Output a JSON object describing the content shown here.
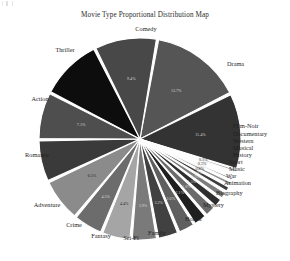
{
  "chart_data": {
    "type": "pie",
    "title": "Movie Type Proportional Distribution Map",
    "xlabel": "",
    "ylabel": "",
    "grid": false,
    "legend_position": "radial-outside-labels",
    "start_angle_deg": -80,
    "direction": "clockwise",
    "categories": [
      "Comedy",
      "Drama",
      "Film-Noir",
      "Documentary",
      "Western",
      "Musical",
      "History",
      "Sport",
      "Music",
      "War",
      "Animation",
      "Biography",
      "Mystery",
      "Horror",
      "Family",
      "Sci-Fi",
      "Fantasy",
      "Crime",
      "Adventure",
      "Romance",
      "Action",
      "Thriller"
    ],
    "values": [
      13.7,
      11.4,
      0.3,
      0.4,
      0.5,
      0.6,
      0.8,
      1.0,
      1.2,
      1.5,
      1.8,
      2.1,
      2.6,
      3.2,
      3.9,
      4.4,
      4.5,
      6.5,
      6.3,
      7.1,
      9.3,
      9.4
    ],
    "slices": [
      {
        "label": "Comedy",
        "value": 13.7,
        "pct_text": "13.7%",
        "color": "#555555",
        "pct_visible": true,
        "pct_on_light": false
      },
      {
        "label": "Drama",
        "value": 11.4,
        "pct_text": "11.4%",
        "color": "#333333",
        "pct_visible": true,
        "pct_on_light": false
      },
      {
        "label": "Film-Noir",
        "value": 0.3,
        "pct_text": "0.3%",
        "color": "#8c8c8c",
        "pct_visible": true,
        "pct_on_light": true
      },
      {
        "label": "Documentary",
        "value": 0.4,
        "pct_text": "0.4%",
        "color": "#6f6f6f",
        "pct_visible": true,
        "pct_on_light": false
      },
      {
        "label": "Western",
        "value": 0.5,
        "pct_text": "0.5%",
        "color": "#a8a8a8",
        "pct_visible": true,
        "pct_on_light": true
      },
      {
        "label": "Musical",
        "value": 0.6,
        "pct_text": "0.6%",
        "color": "#4a4a4a",
        "pct_visible": true,
        "pct_on_light": false
      },
      {
        "label": "History",
        "value": 0.8,
        "pct_text": "0.8%",
        "color": "#909090",
        "pct_visible": true,
        "pct_on_light": true
      },
      {
        "label": "Sport",
        "value": 1.0,
        "pct_text": "1.0%",
        "color": "#3d3d3d",
        "pct_visible": true,
        "pct_on_light": false
      },
      {
        "label": "Music",
        "value": 1.2,
        "pct_text": "1.2%",
        "color": "#7d7d7d",
        "pct_visible": true,
        "pct_on_light": false
      },
      {
        "label": "War",
        "value": 1.5,
        "pct_text": "1.5%",
        "color": "#2e2e2e",
        "pct_visible": true,
        "pct_on_light": false
      },
      {
        "label": "Animation",
        "value": 1.8,
        "pct_text": "1.8%",
        "color": "#6a6a6a",
        "pct_visible": true,
        "pct_on_light": false
      },
      {
        "label": "Biography",
        "value": 2.1,
        "pct_text": "2.1%",
        "color": "#1f1f1f",
        "pct_visible": true,
        "pct_on_light": false
      },
      {
        "label": "Mystery",
        "value": 2.6,
        "pct_text": "2.6%",
        "color": "#5f5f5f",
        "pct_visible": true,
        "pct_on_light": false
      },
      {
        "label": "Horror",
        "value": 3.2,
        "pct_text": "3.2%",
        "color": "#414141",
        "pct_visible": true,
        "pct_on_light": false
      },
      {
        "label": "Family",
        "value": 3.9,
        "pct_text": "3.9%",
        "color": "#7a7a7a",
        "pct_visible": true,
        "pct_on_light": false
      },
      {
        "label": "Sci-Fi",
        "value": 4.4,
        "pct_text": "4.4%",
        "color": "#a5a5a5",
        "pct_visible": true,
        "pct_on_light": true
      },
      {
        "label": "Fantasy",
        "value": 4.5,
        "pct_text": "4.5%",
        "color": "#6c6c6c",
        "pct_visible": true,
        "pct_on_light": false
      },
      {
        "label": "Crime",
        "value": 6.5,
        "pct_text": "6.5%",
        "color": "#8b8b8b",
        "pct_visible": true,
        "pct_on_light": true
      },
      {
        "label": "Adventure",
        "value": 6.3,
        "pct_text": "6.3%",
        "color": "#3a3a3a",
        "pct_visible": false,
        "pct_on_light": false
      },
      {
        "label": "Romance",
        "value": 7.1,
        "pct_text": "7.1%",
        "color": "#4e4e4e",
        "pct_visible": true,
        "pct_on_light": false
      },
      {
        "label": "Action",
        "value": 9.3,
        "pct_text": "9.3%",
        "color": "#0d0d0d",
        "pct_visible": false,
        "pct_on_light": false
      },
      {
        "label": "Thriller",
        "value": 9.4,
        "pct_text": "9.4%",
        "color": "#484848",
        "pct_visible": true,
        "pct_on_light": false
      }
    ]
  },
  "colors": {
    "background": "#ffffff",
    "title_text": "#2b2b2b",
    "label_text": "#1f1f1f",
    "slice_separator": "#ffffff"
  }
}
